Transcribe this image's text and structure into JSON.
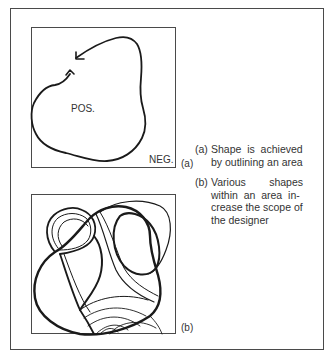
{
  "figure_a": {
    "inner_label": "POS.",
    "outer_label": "NEG.",
    "tag": "(a)"
  },
  "figure_b": {
    "tag": "(b)"
  },
  "captions": [
    {
      "tag": "(a)",
      "text": "Shape is achieved by outlining an area"
    },
    {
      "tag": "(b)",
      "text": "Various shapes within an area increase the scope of the designer"
    }
  ],
  "caption_lines": {
    "a": [
      "Shape  is  achieved",
      "by outlining an area"
    ],
    "b": [
      "Various        shapes",
      "within  an  area  in-",
      "crease the scope of",
      "the designer"
    ]
  },
  "colors": {
    "stroke": "#1a1a1a",
    "border": "#4a4a4a",
    "text": "#333333"
  }
}
